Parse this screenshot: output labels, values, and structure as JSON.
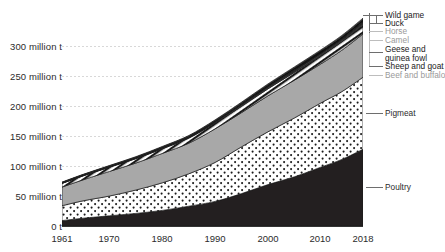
{
  "chart_data": {
    "type": "area",
    "title": "",
    "subtitle": "",
    "xlabel": "",
    "ylabel": "",
    "stacked": true,
    "grid": true,
    "legend_position": "right",
    "xlim": [
      1961,
      2018
    ],
    "ylim": [
      0,
      340
    ],
    "y_unit": "million t",
    "x_tick_labels": [
      "1961",
      "1970",
      "1980",
      "1990",
      "2000",
      "2010",
      "2018"
    ],
    "x_ticks": [
      1961,
      1970,
      1980,
      1990,
      2000,
      2010,
      2018
    ],
    "y_tick_labels": [
      "0 t",
      "50 million t",
      "100 million t",
      "150 million t",
      "200 million t",
      "250 million t",
      "300 million t"
    ],
    "y_ticks": [
      0,
      50,
      100,
      150,
      200,
      250,
      300
    ],
    "x": [
      1961,
      1965,
      1970,
      1975,
      1980,
      1985,
      1990,
      1995,
      2000,
      2005,
      2010,
      2014,
      2018
    ],
    "series": [
      {
        "name": "Poultry",
        "fill": "#231f20",
        "pattern": "solid",
        "values": [
          9,
          13,
          17,
          21,
          26,
          33,
          41,
          54,
          69,
          82,
          98,
          111,
          128
        ]
      },
      {
        "name": "Pigmeat",
        "fill": "#ffffff",
        "pattern": "dots",
        "values": [
          24.8,
          29,
          33,
          39,
          46,
          54,
          65,
          78,
          88,
          98,
          107,
          113,
          120
        ]
      },
      {
        "name": "Beef and buffalo",
        "fill": "#a8a8a8",
        "pattern": "solid-gray",
        "values": [
          31,
          35,
          41,
          45,
          49,
          51,
          56,
          57,
          60,
          63,
          65,
          69,
          72
        ]
      },
      {
        "name": "Sheep and goat",
        "fill": "#ffffff",
        "pattern": "diagonal-hatch",
        "values": [
          6.1,
          6.5,
          7.0,
          7.2,
          7.7,
          8.4,
          9.6,
          10.5,
          11.6,
          12.9,
          13.5,
          14.3,
          15.5
        ]
      },
      {
        "name": "Geese and guinea fowl",
        "fill": "#3a3a3a",
        "pattern": "solid",
        "values": [
          0.5,
          0.6,
          0.7,
          0.8,
          0.9,
          1.0,
          1.3,
          1.9,
          2.4,
          2.7,
          2.9,
          3.0,
          3.1
        ]
      },
      {
        "name": "Camel",
        "fill": "#d9d9d9",
        "pattern": "solid",
        "values": [
          0.3,
          0.3,
          0.3,
          0.3,
          0.4,
          0.4,
          0.4,
          0.5,
          0.5,
          0.5,
          0.6,
          0.6,
          0.6
        ]
      },
      {
        "name": "Horse",
        "fill": "#c4c4c4",
        "pattern": "solid",
        "values": [
          0.5,
          0.5,
          0.5,
          0.6,
          0.6,
          0.6,
          0.6,
          0.7,
          0.7,
          0.7,
          0.7,
          0.7,
          0.8
        ]
      },
      {
        "name": "Duck",
        "fill": "#111111",
        "pattern": "solid",
        "values": [
          0.4,
          0.5,
          0.6,
          0.8,
          1.0,
          1.3,
          1.8,
          2.5,
          3.2,
          3.8,
          4.2,
          4.4,
          4.6
        ]
      },
      {
        "name": "Wild game",
        "fill": "#6b6b6b",
        "pattern": "solid",
        "values": [
          0.6,
          0.7,
          0.8,
          0.9,
          1.0,
          1.1,
          1.2,
          1.3,
          1.4,
          1.5,
          1.6,
          1.7,
          1.8
        ]
      }
    ],
    "annotations": [
      {
        "label": "Wild game",
        "style": "bold"
      },
      {
        "label": "Duck",
        "style": "bold"
      },
      {
        "label": "Horse",
        "style": "faint"
      },
      {
        "label": "Camel",
        "style": "faint"
      },
      {
        "label": "Geese and",
        "style": "bold"
      },
      {
        "label": "guinea fowl",
        "style": "bold"
      },
      {
        "label": "Sheep and goat",
        "style": "bold"
      },
      {
        "label": "Beef and buffalo",
        "style": "faint"
      },
      {
        "label": "Pigmeat",
        "style": "normal"
      },
      {
        "label": "Poultry",
        "style": "normal"
      }
    ]
  },
  "axis": {
    "y": [
      {
        "label": "300 million t"
      },
      {
        "label": "250 million t"
      },
      {
        "label": "200 million t"
      },
      {
        "label": "150 million t"
      },
      {
        "label": "100 million t"
      },
      {
        "label": "50 million t"
      },
      {
        "label": "0 t"
      }
    ],
    "x": [
      {
        "label": "1961"
      },
      {
        "label": "1970"
      },
      {
        "label": "1980"
      },
      {
        "label": "1990"
      },
      {
        "label": "2000"
      },
      {
        "label": "2010"
      },
      {
        "label": "2018"
      }
    ]
  },
  "callouts": {
    "wild_game": "Wild game",
    "duck": "Duck",
    "horse": "Horse",
    "camel": "Camel",
    "geese_line1": "Geese and",
    "geese_line2": "guinea fowl",
    "sheep_and_goat": "Sheep and goat",
    "beef_and_buffalo": "Beef and buffalo",
    "pigmeat": "Pigmeat",
    "poultry": "Poultry"
  },
  "colors": {
    "poultry": "#231f20",
    "pigmeat": "#ffffff",
    "beef": "#a8a8a8",
    "sheep": "#ffffff",
    "axis_text": "#2b2b2b",
    "grid": "#d8d8d8",
    "faint_text": "#9a9a9a"
  }
}
